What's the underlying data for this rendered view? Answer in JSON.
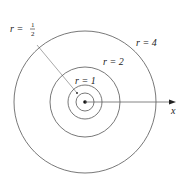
{
  "diagram": {
    "center": {
      "x": 85,
      "y": 102
    },
    "circles": [
      {
        "label": "r = 1/2",
        "radius_px": 9
      },
      {
        "label": "r = 1",
        "radius_px": 17
      },
      {
        "label": "r = 2",
        "radius_px": 35
      },
      {
        "label": "r = 4",
        "radius_px": 71
      }
    ],
    "labels": {
      "r_half_prefix": "r =",
      "r_half_num": "1",
      "r_half_den": "2",
      "r1": "r = 1",
      "r2": "r = 2",
      "r4": "r = 4",
      "x_axis": "x"
    },
    "colors": {
      "stroke": "#555555",
      "pointer": "#aaaaaa",
      "axis": "#666666"
    }
  }
}
